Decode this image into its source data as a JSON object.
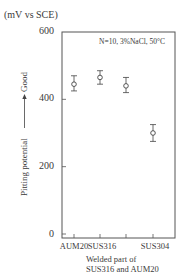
{
  "chart_data": {
    "type": "scatter",
    "title": "",
    "annotation": "N=10, 3%NaCl, 50°C",
    "unit_label": "(mV vs SCE)",
    "ylabel": "Pitting potential",
    "ylabel_arrow_text": "Good",
    "xlabel": "",
    "ylim": [
      0,
      600
    ],
    "yticks": [
      0,
      200,
      400,
      600
    ],
    "grid": false,
    "legend": null,
    "categories": [
      "AUM20",
      "SUS316",
      "Welded part of SUS316 and AUM20",
      "SUS304"
    ],
    "tick_labels": [
      "AUM20",
      "SUS316",
      "",
      "SUS304"
    ],
    "series": [
      {
        "name": "Pitting potential",
        "values": [
          445,
          465,
          440,
          300
        ],
        "error_low": [
          425,
          445,
          420,
          275
        ],
        "error_high": [
          470,
          485,
          465,
          325
        ]
      }
    ],
    "welded_label_lines": [
      "Welded part of",
      "SUS316 and AUM20"
    ]
  },
  "axis": {
    "y_tick_labels": [
      "600",
      "400",
      "200",
      "0"
    ]
  }
}
